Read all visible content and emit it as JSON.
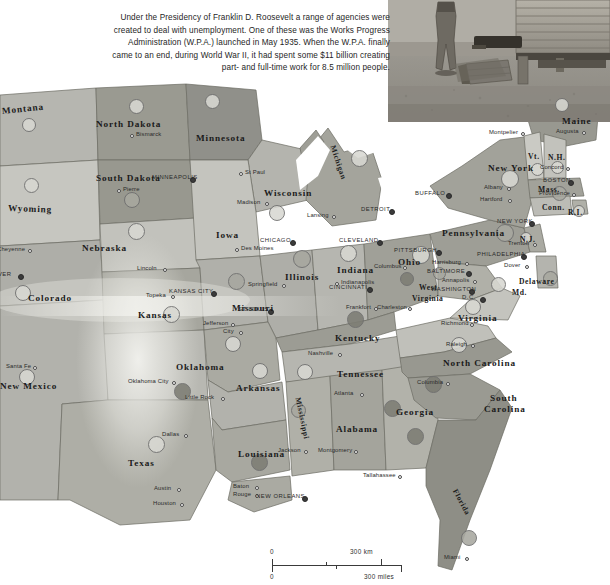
{
  "top_strip_text": "·  ·  ·   ·    ·   ·",
  "caption": {
    "text": "Under the Presidency of Franklin D. Roosevelt a range of agencies were created to deal with unemployment. One of these was the Works Progress Administration (W.P.A.) launched in May 1935. When the W.P.A. finally came to an end, during World War II, it had spent some $11 billion  creating part- and full-time work for 8.5 million people."
  },
  "photo": {
    "alt": "Depression-era photograph of a man standing beside a wooden wagon"
  },
  "scale": {
    "km_zero": "0",
    "km_label": "300 km",
    "miles_zero": "0",
    "miles_label": "300 miles"
  },
  "colors": {
    "land_light": "#c9c9c4",
    "land_mid": "#b0b0aa",
    "land_dark": "#98988f",
    "land_darker": "#86867d",
    "border": "#6b6b63",
    "water": "#ffffff",
    "circle_light": "#d8d8d2",
    "circle_mid": "#a8a8a0",
    "circle_dark": "#7d7d74",
    "text": "#1b1b1b"
  },
  "states": [
    {
      "name": "Montana",
      "x": 2,
      "y": 106,
      "size": "norm",
      "rot": -6
    },
    {
      "name": "North Dakota",
      "x": 96,
      "y": 119,
      "size": "norm",
      "rot": 0
    },
    {
      "name": "Minnesota",
      "x": 196,
      "y": 133,
      "size": "norm",
      "rot": 0
    },
    {
      "name": "South Dakota",
      "x": 96,
      "y": 173,
      "size": "norm",
      "rot": 0
    },
    {
      "name": "Wyoming",
      "x": 8,
      "y": 203,
      "size": "norm",
      "rot": 2
    },
    {
      "name": "Wisconsin",
      "x": 264,
      "y": 188,
      "size": "norm",
      "rot": 0
    },
    {
      "name": "Nebraska",
      "x": 82,
      "y": 243,
      "size": "norm",
      "rot": 0
    },
    {
      "name": "Iowa",
      "x": 216,
      "y": 230,
      "size": "norm",
      "rot": 0
    },
    {
      "name": "Illinois",
      "x": 285,
      "y": 272,
      "size": "norm",
      "rot": 0
    },
    {
      "name": "Indiana",
      "x": 337,
      "y": 265,
      "size": "norm",
      "rot": 0
    },
    {
      "name": "Ohio",
      "x": 398,
      "y": 257,
      "size": "norm",
      "rot": 0
    },
    {
      "name": "Colorado",
      "x": 28,
      "y": 293,
      "size": "norm",
      "rot": 0
    },
    {
      "name": "Kansas",
      "x": 138,
      "y": 310,
      "size": "norm",
      "rot": 0
    },
    {
      "name": "Missouri",
      "x": 232,
      "y": 303,
      "size": "norm",
      "rot": 0
    },
    {
      "name": "Kentucky",
      "x": 335,
      "y": 333,
      "size": "norm",
      "rot": 0
    },
    {
      "name": "New Mexico",
      "x": 0,
      "y": 381,
      "size": "norm",
      "rot": 0
    },
    {
      "name": "Oklahoma",
      "x": 176,
      "y": 362,
      "size": "norm",
      "rot": 0
    },
    {
      "name": "Arkansas",
      "x": 236,
      "y": 383,
      "size": "norm",
      "rot": 0
    },
    {
      "name": "Tennessee",
      "x": 337,
      "y": 369,
      "size": "norm",
      "rot": 0
    },
    {
      "name": "Texas",
      "x": 128,
      "y": 458,
      "size": "norm",
      "rot": 0
    },
    {
      "name": "Louisiana",
      "x": 238,
      "y": 449,
      "size": "norm",
      "rot": 0
    },
    {
      "name": "Alabama",
      "x": 336,
      "y": 424,
      "size": "norm",
      "rot": 0
    },
    {
      "name": "Georgia",
      "x": 396,
      "y": 407,
      "size": "norm",
      "rot": 0
    },
    {
      "name": "Mississippi",
      "x": 298,
      "y": 393,
      "size": "sm",
      "rot": 78
    },
    {
      "name": "Florida",
      "x": 455,
      "y": 485,
      "size": "sm",
      "rot": 62
    },
    {
      "name": "Michigan",
      "x": 333,
      "y": 141,
      "size": "sm",
      "rot": 72
    },
    {
      "name": "Pennsylvania",
      "x": 442,
      "y": 228,
      "size": "norm",
      "rot": 0
    },
    {
      "name": "New York",
      "x": 488,
      "y": 163,
      "size": "norm",
      "rot": 0
    },
    {
      "name": "Maine",
      "x": 562,
      "y": 116,
      "size": "norm",
      "rot": 0
    },
    {
      "name": "Vt.",
      "x": 528,
      "y": 152,
      "size": "sm",
      "rot": 0
    },
    {
      "name": "N.H.",
      "x": 548,
      "y": 153,
      "size": "sm",
      "rot": 0
    },
    {
      "name": "Mass.",
      "x": 538,
      "y": 185,
      "size": "sm",
      "rot": 0
    },
    {
      "name": "Conn.",
      "x": 542,
      "y": 203,
      "size": "sm",
      "rot": 0
    },
    {
      "name": "R.I.",
      "x": 568,
      "y": 208,
      "size": "sm",
      "rot": 0
    },
    {
      "name": "N.J.",
      "x": 520,
      "y": 235,
      "size": "sm",
      "rot": 0
    },
    {
      "name": "Delaware",
      "x": 519,
      "y": 277,
      "size": "sm",
      "rot": 0
    },
    {
      "name": "Md.",
      "x": 512,
      "y": 288,
      "size": "sm",
      "rot": 0
    },
    {
      "name": "West",
      "x": 419,
      "y": 283,
      "size": "sm",
      "rot": 0
    },
    {
      "name": "Virginia",
      "x": 412,
      "y": 294,
      "size": "sm",
      "rot": 0
    },
    {
      "name": "Virginia",
      "x": 458,
      "y": 313,
      "size": "norm",
      "rot": 0
    },
    {
      "name": "North Carolina",
      "x": 443,
      "y": 358,
      "size": "norm",
      "rot": 0
    },
    {
      "name": "South",
      "x": 490,
      "y": 393,
      "size": "norm",
      "rot": 0
    },
    {
      "name": "Carolina",
      "x": 484,
      "y": 404,
      "size": "norm",
      "rot": 0
    }
  ],
  "cities": [
    {
      "name": "Bismarck",
      "x": 131,
      "y": 135,
      "dx": -7,
      "caps": false
    },
    {
      "name": "Pierre",
      "x": 118,
      "y": 190,
      "dx": -7,
      "caps": false
    },
    {
      "name": "MINNEAPOLIS",
      "x": 191,
      "y": 178,
      "dx": 36,
      "caps": true
    },
    {
      "name": "St Paul",
      "x": 240,
      "y": 173,
      "dx": -7,
      "caps": false
    },
    {
      "name": "Madison",
      "x": 266,
      "y": 203,
      "dx": 26,
      "caps": false
    },
    {
      "name": "Lansing",
      "x": 333,
      "y": 216,
      "dx": 23,
      "caps": false
    },
    {
      "name": "DETROIT",
      "x": 390,
      "y": 210,
      "dx": 26,
      "caps": true
    },
    {
      "name": "Cheyenne",
      "x": 29,
      "y": 250,
      "dx": 29,
      "caps": false
    },
    {
      "name": "Des Moines",
      "x": 236,
      "y": 249,
      "dx": -7,
      "caps": false
    },
    {
      "name": "CHICAGO",
      "x": 291,
      "y": 241,
      "dx": 28,
      "caps": true
    },
    {
      "name": "CLEVELAND",
      "x": 378,
      "y": 241,
      "dx": 36,
      "caps": true
    },
    {
      "name": "PITTSBURGH",
      "x": 437,
      "y": 251,
      "dx": 40,
      "caps": true
    },
    {
      "name": "Lincoln",
      "x": 164,
      "y": 269,
      "dx": 24,
      "caps": false
    },
    {
      "name": "DENVER",
      "x": 19,
      "y": 275,
      "dx": 32,
      "caps": true
    },
    {
      "name": "Indianapolis",
      "x": 336,
      "y": 283,
      "dx": -7,
      "caps": false
    },
    {
      "name": "Columbus",
      "x": 404,
      "y": 267,
      "dx": 27,
      "caps": false
    },
    {
      "name": "Springfield",
      "x": 283,
      "y": 285,
      "dx": 32,
      "caps": false
    },
    {
      "name": "Harrisburg",
      "x": 466,
      "y": 263,
      "dx": 31,
      "caps": false
    },
    {
      "name": "Albany",
      "x": 508,
      "y": 188,
      "dx": 21,
      "caps": false
    },
    {
      "name": "BOSTON",
      "x": 569,
      "y": 181,
      "dx": 23,
      "caps": true
    },
    {
      "name": "Concord",
      "x": 567,
      "y": 168,
      "dx": 24,
      "caps": false
    },
    {
      "name": "Montpelier",
      "x": 522,
      "y": 133,
      "dx": 30,
      "caps": false
    },
    {
      "name": "Augusta",
      "x": 583,
      "y": 132,
      "dx": 24,
      "caps": false
    },
    {
      "name": "Hartford",
      "x": 509,
      "y": 200,
      "dx": 26,
      "caps": false
    },
    {
      "name": "Providence",
      "x": 573,
      "y": 194,
      "dx": 31,
      "caps": false
    },
    {
      "name": "NEW YORK",
      "x": 530,
      "y": 222,
      "dx": 30,
      "caps": true
    },
    {
      "name": "Trenton",
      "x": 534,
      "y": 244,
      "dx": 23,
      "caps": false
    },
    {
      "name": "PHILADELPHIA",
      "x": 522,
      "y": 255,
      "dx": 42,
      "caps": true
    },
    {
      "name": "Dover",
      "x": 526,
      "y": 266,
      "dx": 19,
      "caps": false
    },
    {
      "name": "BALTIMORE",
      "x": 467,
      "y": 272,
      "dx": 37,
      "caps": true
    },
    {
      "name": "Annapolis",
      "x": 474,
      "y": 281,
      "dx": 29,
      "caps": false
    },
    {
      "name": "WASHINGTON",
      "x": 470,
      "y": 290,
      "dx": 36,
      "caps": true
    },
    {
      "name": "D.C.",
      "x": 481,
      "y": 298,
      "dx": 16,
      "caps": true
    },
    {
      "name": "KANSAS CITY",
      "x": 212,
      "y": 292,
      "dx": 40,
      "caps": true
    },
    {
      "name": "Topeka",
      "x": 172,
      "y": 296,
      "dx": 23,
      "caps": false
    },
    {
      "name": "ST LOUIS",
      "x": 269,
      "y": 310,
      "dx": 28,
      "caps": true
    },
    {
      "name": "CINCINNATI",
      "x": 368,
      "y": 288,
      "dx": 36,
      "caps": true
    },
    {
      "name": "Frankfort",
      "x": 375,
      "y": 308,
      "dx": 26,
      "caps": false
    },
    {
      "name": "Charleston",
      "x": 409,
      "y": 308,
      "dx": 29,
      "caps": false
    },
    {
      "name": "Richmond",
      "x": 471,
      "y": 324,
      "dx": 27,
      "caps": false
    },
    {
      "name": "Jefferson",
      "x": 232,
      "y": 324,
      "dx": 26,
      "caps": false
    },
    {
      "name": "City",
      "x": 240,
      "y": 332,
      "dx": 14,
      "caps": false
    },
    {
      "name": "Santa Fe",
      "x": 34,
      "y": 367,
      "dx": 25,
      "caps": false
    },
    {
      "name": "Raleigh",
      "x": 472,
      "y": 345,
      "dx": 23,
      "caps": false
    },
    {
      "name": "Nashville",
      "x": 339,
      "y": 354,
      "dx": 28,
      "caps": false
    },
    {
      "name": "Oklahoma City",
      "x": 173,
      "y": 382,
      "dx": 42,
      "caps": false
    },
    {
      "name": "Little Rock",
      "x": 222,
      "y": 398,
      "dx": 34,
      "caps": false
    },
    {
      "name": "Atlanta",
      "x": 361,
      "y": 394,
      "dx": 24,
      "caps": false
    },
    {
      "name": "Columbia",
      "x": 447,
      "y": 383,
      "dx": 27,
      "caps": false
    },
    {
      "name": "Dallas",
      "x": 185,
      "y": 435,
      "dx": 20,
      "caps": false
    },
    {
      "name": "Jackson",
      "x": 305,
      "y": 451,
      "dx": 24,
      "caps": false
    },
    {
      "name": "Montgomery",
      "x": 355,
      "y": 451,
      "dx": 34,
      "caps": false
    },
    {
      "name": "Tallahassee",
      "x": 399,
      "y": 476,
      "dx": 33,
      "caps": false
    },
    {
      "name": "Austin",
      "x": 178,
      "y": 489,
      "dx": 21,
      "caps": false
    },
    {
      "name": "Baton",
      "x": 256,
      "y": 487,
      "dx": 20,
      "caps": false
    },
    {
      "name": "Rouge",
      "x": 256,
      "y": 495,
      "dx": 20,
      "caps": false
    },
    {
      "name": "Houston",
      "x": 181,
      "y": 504,
      "dx": 25,
      "caps": false
    },
    {
      "name": "NEW ORLEANS",
      "x": 303,
      "y": 497,
      "dx": 44,
      "caps": true
    },
    {
      "name": "Miami",
      "x": 466,
      "y": 558,
      "dx": 19,
      "caps": false
    },
    {
      "name": "BUFFALO",
      "x": 447,
      "y": 194,
      "dx": 29,
      "caps": true
    }
  ],
  "circles": [
    {
      "x": 135,
      "y": 105,
      "r": 6.5,
      "shade": "circle_light"
    },
    {
      "x": 28,
      "y": 124,
      "r": 6.0,
      "shade": "circle_light"
    },
    {
      "x": 30,
      "y": 184,
      "r": 6.5,
      "shade": "circle_light"
    },
    {
      "x": 131,
      "y": 199,
      "r": 7.0,
      "shade": "circle_mid"
    },
    {
      "x": 211,
      "y": 100,
      "r": 6.5,
      "shade": "circle_light"
    },
    {
      "x": 135,
      "y": 230,
      "r": 7.5,
      "shade": "circle_light"
    },
    {
      "x": 22,
      "y": 292,
      "r": 7.0,
      "shade": "circle_light"
    },
    {
      "x": 170,
      "y": 313,
      "r": 7.5,
      "shade": "circle_light"
    },
    {
      "x": 235,
      "y": 280,
      "r": 7.5,
      "shade": "circle_mid"
    },
    {
      "x": 232,
      "y": 343,
      "r": 7.0,
      "shade": "circle_light"
    },
    {
      "x": 276,
      "y": 212,
      "r": 7.0,
      "shade": "circle_light"
    },
    {
      "x": 301,
      "y": 258,
      "r": 8.0,
      "shade": "circle_mid"
    },
    {
      "x": 347,
      "y": 252,
      "r": 7.5,
      "shade": "circle_light"
    },
    {
      "x": 358,
      "y": 157,
      "r": 7.5,
      "shade": "circle_light"
    },
    {
      "x": 420,
      "y": 254,
      "r": 8.0,
      "shade": "circle_light"
    },
    {
      "x": 438,
      "y": 272,
      "r": 5.5,
      "shade": "circle_mid"
    },
    {
      "x": 354,
      "y": 318,
      "r": 7.5,
      "shade": "circle_dark"
    },
    {
      "x": 406,
      "y": 278,
      "r": 6.0,
      "shade": "circle_dark"
    },
    {
      "x": 504,
      "y": 232,
      "r": 8.0,
      "shade": "circle_mid"
    },
    {
      "x": 509,
      "y": 178,
      "r": 8.0,
      "shade": "circle_light"
    },
    {
      "x": 536,
      "y": 168,
      "r": 5.5,
      "shade": "circle_light"
    },
    {
      "x": 556,
      "y": 166,
      "r": 5.5,
      "shade": "circle_light"
    },
    {
      "x": 558,
      "y": 192,
      "r": 6.5,
      "shade": "circle_mid"
    },
    {
      "x": 578,
      "y": 210,
      "r": 5.0,
      "shade": "circle_light"
    },
    {
      "x": 561,
      "y": 104,
      "r": 6.0,
      "shade": "circle_light"
    },
    {
      "x": 525,
      "y": 237,
      "r": 5.0,
      "shade": "circle_light"
    },
    {
      "x": 549,
      "y": 277,
      "r": 6.5,
      "shade": "circle_mid"
    },
    {
      "x": 497,
      "y": 283,
      "r": 6.5,
      "shade": "circle_light"
    },
    {
      "x": 472,
      "y": 306,
      "r": 7.0,
      "shade": "circle_light"
    },
    {
      "x": 458,
      "y": 344,
      "r": 7.0,
      "shade": "circle_light"
    },
    {
      "x": 432,
      "y": 383,
      "r": 7.5,
      "shade": "circle_dark"
    },
    {
      "x": 414,
      "y": 435,
      "r": 7.5,
      "shade": "circle_dark"
    },
    {
      "x": 391,
      "y": 407,
      "r": 7.5,
      "shade": "circle_dark"
    },
    {
      "x": 304,
      "y": 371,
      "r": 7.0,
      "shade": "circle_light"
    },
    {
      "x": 297,
      "y": 409,
      "r": 6.5,
      "shade": "circle_mid"
    },
    {
      "x": 259,
      "y": 370,
      "r": 7.0,
      "shade": "circle_light"
    },
    {
      "x": 181,
      "y": 390,
      "r": 7.5,
      "shade": "circle_dark"
    },
    {
      "x": 155,
      "y": 443,
      "r": 7.5,
      "shade": "circle_light"
    },
    {
      "x": 26,
      "y": 376,
      "r": 7.0,
      "shade": "circle_light"
    },
    {
      "x": 258,
      "y": 461,
      "r": 7.5,
      "shade": "circle_dark"
    },
    {
      "x": 468,
      "y": 537,
      "r": 7.0,
      "shade": "circle_mid"
    }
  ]
}
